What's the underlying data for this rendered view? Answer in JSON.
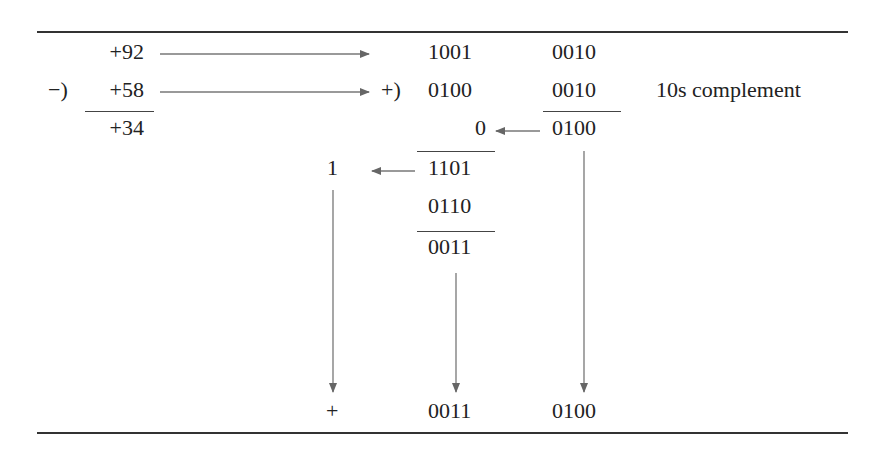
{
  "diagram": {
    "decimal": {
      "minuend": "+92",
      "operator": "−)",
      "subtrahend": "+58",
      "result": "+34"
    },
    "bcd": {
      "row1": {
        "high": "1001",
        "low": "0010"
      },
      "add_operator": "+)",
      "row2": {
        "high": "0100",
        "low": "0010"
      },
      "row2_note": "10s complement",
      "low_sum": "0100",
      "carry_into_high": "0",
      "high_sum": "1101",
      "carry_out": "1",
      "correction": "0110",
      "high_corrected": "0011",
      "final_sign": "+",
      "final_high": "0011",
      "final_low": "0100"
    },
    "colors": {
      "text": "#222222",
      "arrow": "#666666",
      "rule": "#333333"
    }
  }
}
